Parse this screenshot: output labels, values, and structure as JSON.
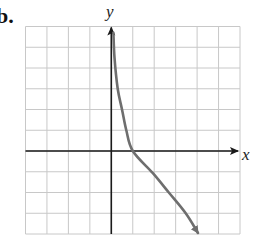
{
  "figure": {
    "part_label": "b.",
    "x_axis_label": "x",
    "y_axis_label": "y",
    "colors": {
      "grid": "#c8c8c8",
      "axis": "#1a1a1a",
      "curve": "#6e6e6e",
      "background": "#ffffff"
    }
  },
  "chart_data": {
    "type": "line",
    "title": "",
    "xlabel": "x",
    "ylabel": "y",
    "grid": true,
    "xlim": [
      -4,
      6
    ],
    "ylim": [
      -4,
      6
    ],
    "grid_step": 1,
    "series": [
      {
        "name": "decreasing logarithmic curve (vertical asymptote at x = 0, x-intercept at (1, 0))",
        "x": [
          0.1,
          0.15,
          0.3,
          0.5,
          0.7,
          1.0,
          1.94,
          2.68,
          3.47,
          4.04
        ],
        "y": [
          5.7,
          4.5,
          3.0,
          2.0,
          1.0,
          0.0,
          -1.07,
          -2.0,
          -3.0,
          -3.95
        ],
        "end_arrow": true
      }
    ],
    "annotations": []
  }
}
